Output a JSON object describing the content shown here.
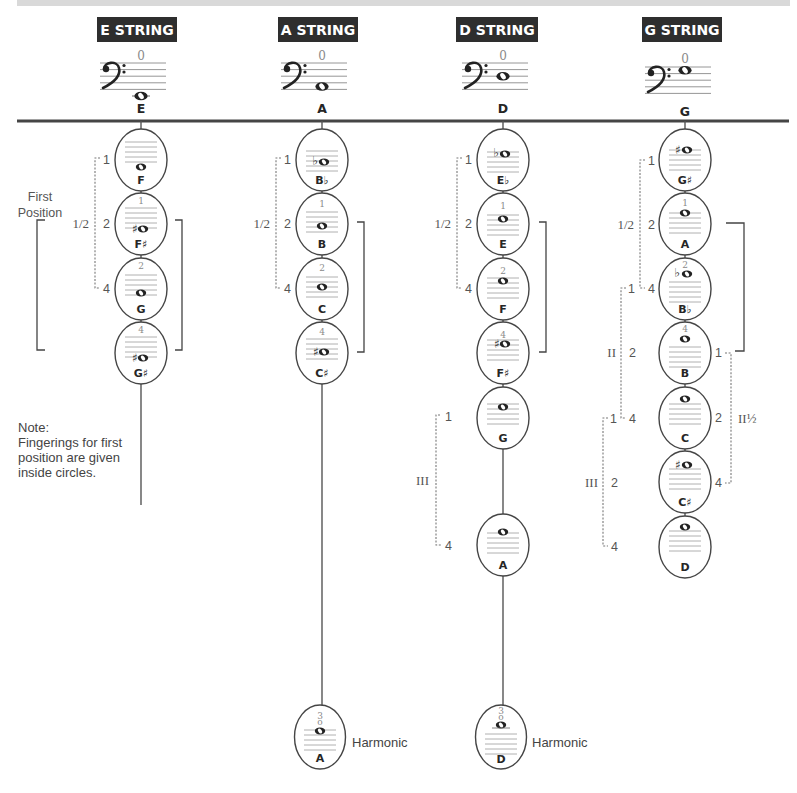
{
  "strings": [
    {
      "title": "E STRING",
      "open_fingering": "0",
      "open_note": "E",
      "notes": [
        {
          "label": "F",
          "fingering": "",
          "accidental": ""
        },
        {
          "label": "F♯",
          "fingering": "1",
          "accidental": "♯"
        },
        {
          "label": "G",
          "fingering": "2",
          "accidental": ""
        },
        {
          "label": "G♯",
          "fingering": "4",
          "accidental": "♯"
        }
      ],
      "positions": {
        "half": {
          "label": "1/2",
          "fingers": [
            "1",
            "2",
            "4"
          ]
        }
      },
      "first_position_label": [
        "First",
        "Position"
      ]
    },
    {
      "title": "A STRING",
      "open_fingering": "0",
      "open_note": "A",
      "notes": [
        {
          "label": "B♭",
          "fingering": "",
          "accidental": "♭"
        },
        {
          "label": "B",
          "fingering": "1",
          "accidental": ""
        },
        {
          "label": "C",
          "fingering": "2",
          "accidental": ""
        },
        {
          "label": "C♯",
          "fingering": "4",
          "accidental": "♯"
        }
      ],
      "harmonic": {
        "label": "A",
        "fingering": "3",
        "mark": "o",
        "caption": "Harmonic"
      },
      "positions": {
        "half": {
          "label": "1/2",
          "fingers": [
            "1",
            "2",
            "4"
          ]
        }
      }
    },
    {
      "title": "D STRING",
      "open_fingering": "0",
      "open_note": "D",
      "notes": [
        {
          "label": "E♭",
          "fingering": "",
          "accidental": "♭"
        },
        {
          "label": "E",
          "fingering": "1",
          "accidental": ""
        },
        {
          "label": "F",
          "fingering": "2",
          "accidental": ""
        },
        {
          "label": "F♯",
          "fingering": "4",
          "accidental": "♯"
        },
        {
          "label": "G",
          "fingering": "",
          "accidental": ""
        },
        {
          "label": "A",
          "fingering": "",
          "accidental": ""
        }
      ],
      "harmonic": {
        "label": "D",
        "fingering": "3",
        "mark": "o",
        "caption": "Harmonic"
      },
      "positions": {
        "half": {
          "label": "1/2",
          "fingers": [
            "1",
            "2",
            "4"
          ]
        },
        "third": {
          "label": "III",
          "fingers": [
            "1",
            "4"
          ]
        }
      }
    },
    {
      "title": "G STRING",
      "open_fingering": "0",
      "open_note": "G",
      "notes": [
        {
          "label": "G♯",
          "fingering": "",
          "accidental": "♯"
        },
        {
          "label": "A",
          "fingering": "1",
          "accidental": ""
        },
        {
          "label": "B♭",
          "fingering": "2",
          "accidental": "♭"
        },
        {
          "label": "B",
          "fingering": "4",
          "accidental": ""
        },
        {
          "label": "C",
          "fingering": "",
          "accidental": ""
        },
        {
          "label": "C♯",
          "fingering": "",
          "accidental": "♯"
        },
        {
          "label": "D",
          "fingering": "",
          "accidental": ""
        }
      ],
      "positions": {
        "half": {
          "label": "1/2",
          "fingers": [
            "1",
            "2",
            "4"
          ]
        },
        "second": {
          "label": "II",
          "fingers": [
            "1",
            "2",
            "4"
          ]
        },
        "third": {
          "label": "III",
          "fingers": [
            "1",
            "2",
            "4"
          ]
        },
        "second_and_half": {
          "label": "II½",
          "fingers": [
            "1",
            "2",
            "4"
          ]
        }
      }
    }
  ],
  "footnote": {
    "title": "Note:",
    "lines": [
      "Fingerings for first",
      "position are given",
      "inside circles."
    ]
  },
  "colors": {
    "title_bg": "#2e2e2e",
    "title_text": "#ffffff",
    "top_band": "#d9d9d9",
    "rule": "#454545"
  }
}
